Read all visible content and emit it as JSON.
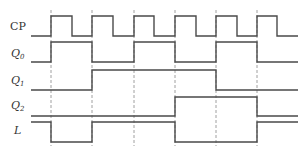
{
  "diagram": {
    "type": "timing-diagram",
    "signals": [
      {
        "name": "CP",
        "italic": false,
        "subscript": ""
      },
      {
        "name": "Q",
        "italic": true,
        "subscript": "0"
      },
      {
        "name": "Q",
        "italic": true,
        "subscript": "1"
      },
      {
        "name": "Q",
        "italic": true,
        "subscript": "2"
      },
      {
        "name": "L",
        "italic": true,
        "subscript": ""
      }
    ],
    "clock_edges": 6,
    "waveforms": {
      "CP": [
        0,
        1,
        0,
        1,
        0,
        1,
        0,
        1,
        0,
        1,
        0,
        1,
        0,
        1
      ],
      "Q0": [
        0,
        1,
        0,
        1,
        0,
        1,
        0
      ],
      "Q1": [
        0,
        0,
        1,
        1,
        1,
        0,
        0
      ],
      "Q2": [
        0,
        0,
        0,
        0,
        1,
        1,
        0
      ],
      "L": [
        1,
        0,
        1,
        1,
        0,
        0,
        1
      ]
    },
    "colors": {
      "line": "#4a4a4a",
      "grid": "#888888",
      "text": "#333333"
    }
  }
}
